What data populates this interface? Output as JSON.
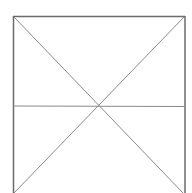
{
  "diagram": {
    "type": "placeholder-cross-box",
    "box": {
      "left": 13,
      "top": 16,
      "right": 185,
      "bottom": 193
    },
    "horizontal_line_y": 106,
    "center": {
      "x": 98,
      "y": 106
    },
    "colors": {
      "background": "#ffffff",
      "frame": "#6b6b6b",
      "lines": "#8a8a8a"
    }
  }
}
